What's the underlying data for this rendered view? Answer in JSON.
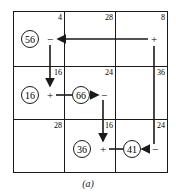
{
  "caption": "(a)",
  "grid": {
    "rows": 3,
    "cols": 3
  },
  "costs": [
    [
      "4",
      "28",
      "8"
    ],
    [
      "16",
      "24",
      "36"
    ],
    [
      "",
      "28",
      "16",
      "24"
    ]
  ],
  "cost_cells": [
    {
      "row": 0,
      "col": 0,
      "value": "4"
    },
    {
      "row": 0,
      "col": 1,
      "value": "28"
    },
    {
      "row": 0,
      "col": 2,
      "value": "8"
    },
    {
      "row": 1,
      "col": 0,
      "value": "16"
    },
    {
      "row": 1,
      "col": 1,
      "value": "24"
    },
    {
      "row": 1,
      "col": 2,
      "value": "36"
    },
    {
      "row": 2,
      "col": 0,
      "value": "28"
    },
    {
      "row": 2,
      "col": 1,
      "value": "16"
    },
    {
      "row": 2,
      "col": 2,
      "value": "24"
    }
  ],
  "allocations": [
    {
      "row": 0,
      "col": 0,
      "value": "56",
      "sign": "−"
    },
    {
      "row": 1,
      "col": 0,
      "value": "16",
      "sign": "+"
    },
    {
      "row": 1,
      "col": 1,
      "value": "66",
      "sign": "−"
    },
    {
      "row": 2,
      "col": 1,
      "value": "36",
      "sign": "+"
    },
    {
      "row": 2,
      "col": 2,
      "value": "41",
      "sign": "−"
    }
  ],
  "entering_cell": {
    "row": 0,
    "col": 2,
    "sign": "+"
  }
}
